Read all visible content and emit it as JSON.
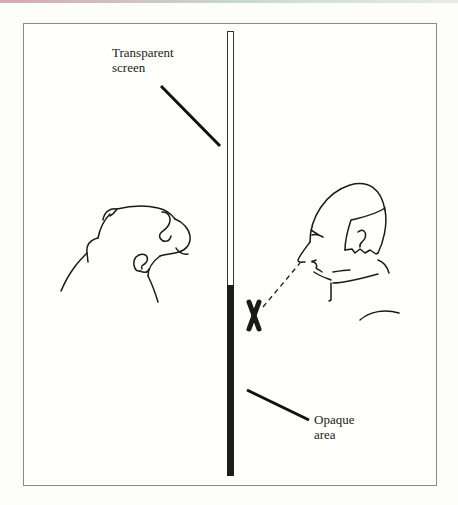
{
  "diagram": {
    "labels": {
      "transparent_screen": [
        "Transparent",
        "screen"
      ],
      "opaque_area": [
        "Opaque",
        "area"
      ],
      "marker": "X"
    },
    "figures": [
      "monkey-head",
      "human-head"
    ],
    "colors": {
      "ink": "#1a1a1a",
      "frame": "#8a8a8a",
      "background": "#fefefb"
    }
  }
}
